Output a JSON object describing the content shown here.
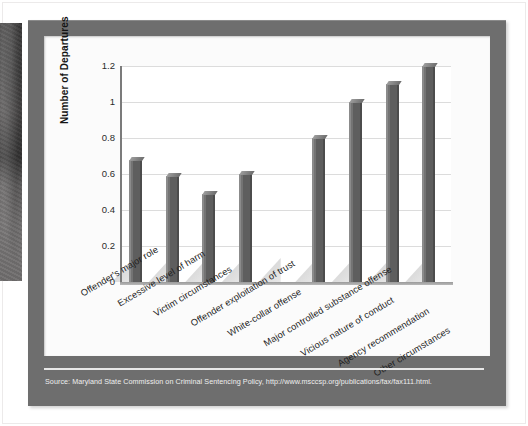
{
  "figure": {
    "source_note": "Source: Maryland State Commission on Criminal Sentencing Policy, http://www.msccsp.org/publications/fax/fax111.html.",
    "frame_color": "#6e6e6e",
    "canvas_color": "#fbfbfb",
    "bar_color": "#5e5e5e",
    "gridline_color": "#dcdcdc",
    "axis_color": "#7b7b7b"
  },
  "chart_data": {
    "type": "bar",
    "title": "",
    "xlabel": "",
    "ylabel": "Number of Departures",
    "ylim": [
      0,
      1.2
    ],
    "ytick_labels": [
      "0",
      "0.2",
      "0.4",
      "0.6",
      "0.8",
      "1",
      "1.2"
    ],
    "ytick_values": [
      0,
      0.2,
      0.4,
      0.6,
      0.8,
      1.0,
      1.2
    ],
    "grid": true,
    "legend": "none",
    "categories": [
      "Offender's major role",
      "Excessive level of harm",
      "Victim circumstances",
      "Offender exploitation of trust",
      "White-collar offense",
      "Major controlled substance offense",
      "Vicious nature of conduct",
      "Agency recommendation",
      "Other circumstances"
    ],
    "values": [
      0.68,
      0.59,
      0.49,
      0.6,
      0,
      0.8,
      1.0,
      1.1,
      1.2
    ]
  }
}
